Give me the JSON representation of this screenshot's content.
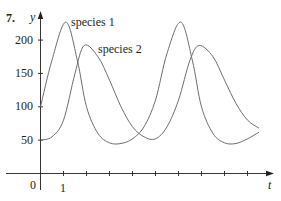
{
  "problem_number": "7.",
  "chart_data": {
    "type": "line",
    "title": "",
    "xlabel": "t",
    "ylabel": "y",
    "x_ticks": [
      0,
      1,
      2,
      3,
      4,
      5,
      6,
      7,
      8,
      9
    ],
    "x_tick_labels": [
      "0",
      "1"
    ],
    "y_ticks": [
      50,
      100,
      150,
      200
    ],
    "y_tick_labels": [
      "50",
      "100",
      "150",
      "200"
    ],
    "xlim": [
      0,
      10
    ],
    "ylim": [
      0,
      240
    ],
    "grid": false,
    "legend": "inline labels near curves",
    "series": [
      {
        "name": "species 1",
        "x": [
          0,
          0.5,
          1.1,
          1.6,
          2.0,
          2.5,
          3.0,
          3.5,
          4.0,
          4.5,
          5.0,
          5.5,
          6.1,
          6.6,
          7.0,
          7.5,
          8.0,
          8.5,
          9.0,
          9.5
        ],
        "values": [
          100,
          170,
          227,
          170,
          100,
          60,
          46,
          45,
          52,
          70,
          110,
          180,
          227,
          170,
          100,
          60,
          46,
          45,
          52,
          62
        ]
      },
      {
        "name": "species 2",
        "x": [
          0,
          0.5,
          1.0,
          1.5,
          1.9,
          2.5,
          3.0,
          3.5,
          4.0,
          4.5,
          5.0,
          5.5,
          6.0,
          6.5,
          6.9,
          7.5,
          8.0,
          8.5,
          9.0,
          9.5
        ],
        "values": [
          50,
          55,
          80,
          150,
          192,
          175,
          140,
          100,
          70,
          55,
          52,
          70,
          110,
          170,
          192,
          175,
          140,
          105,
          80,
          68
        ]
      }
    ],
    "annotations": [
      {
        "text": "species 1",
        "near": "first peak of species 1"
      },
      {
        "text": "species 2",
        "near": "first peak of species 2"
      }
    ],
    "line_color": "#6d6e71",
    "axis_color": "#231f20"
  }
}
